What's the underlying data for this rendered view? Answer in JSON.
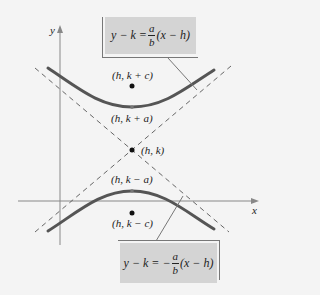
{
  "diagram": {
    "axes": {
      "x_label": "x",
      "y_label": "y"
    },
    "points": [
      {
        "name": "focus-upper",
        "label": "(h, k + c)"
      },
      {
        "name": "vertex-upper",
        "label": "(h, k + a)"
      },
      {
        "name": "center",
        "label": "(h, k)"
      },
      {
        "name": "vertex-lower",
        "label": "(h, k − a)"
      },
      {
        "name": "focus-lower",
        "label": "(h, k − c)"
      }
    ],
    "asymptotes": {
      "positive": {
        "lhs": "y − k = ",
        "frac_num": "a",
        "frac_den": "b",
        "rhs": "(x − h)"
      },
      "negative": {
        "lhs": "y − k = −",
        "frac_num": "a",
        "frac_den": "b",
        "rhs": "(x − h)"
      }
    },
    "colors": {
      "curve": "#555555",
      "asymptote": "#666666",
      "axis": "#888888",
      "box_fill": "#d4d4d4",
      "background": "#f4f4f4"
    }
  }
}
